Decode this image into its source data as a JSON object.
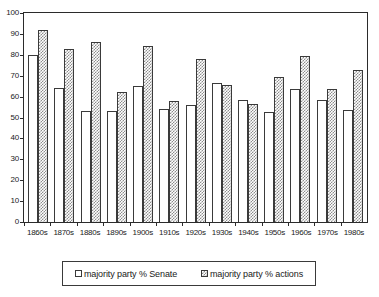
{
  "chart_data": {
    "type": "bar",
    "title": "",
    "subtitle": "",
    "xlabel": "",
    "ylabel": "",
    "ylim": [
      0,
      100
    ],
    "ytick_step": 10,
    "yticks": [
      0,
      10,
      20,
      30,
      40,
      50,
      60,
      70,
      80,
      90,
      100
    ],
    "ytick_labels": [
      "0",
      "10",
      "20",
      "30",
      "40",
      "50",
      "60",
      "70",
      "80",
      "90",
      "100"
    ],
    "grid": false,
    "legend_position": "bottom",
    "categories": [
      "1860s",
      "1870s",
      "1880s",
      "1890s",
      "1900s",
      "1910s",
      "1920s",
      "1930s",
      "1940s",
      "1950s",
      "1960s",
      "1970s",
      "1980s"
    ],
    "series": [
      {
        "name": "majority party % Senate",
        "fill": "solid-white",
        "values": [
          80,
          64,
          53,
          53,
          65,
          54,
          56,
          66.5,
          58.5,
          52.5,
          63.5,
          58.5,
          53.5
        ]
      },
      {
        "name": "majority party % actions",
        "fill": "hatched-gray",
        "values": [
          92,
          83,
          86,
          62,
          84,
          58,
          78,
          65.5,
          56.5,
          69.5,
          79.5,
          63.5,
          72.5
        ]
      }
    ],
    "colors": {
      "senate_fill": "#ffffff",
      "actions_fill": "#8d8d8d",
      "bar_outline": "#3a3a3a",
      "axis": "#2b2b2b",
      "background": "#ffffff",
      "text": "#1a1a1a"
    }
  },
  "legend": {
    "entries": [
      {
        "label": "majority party % Senate",
        "swatch": "white-square-swatch"
      },
      {
        "label": "majority party % actions",
        "swatch": "hatched-square-swatch"
      }
    ]
  }
}
